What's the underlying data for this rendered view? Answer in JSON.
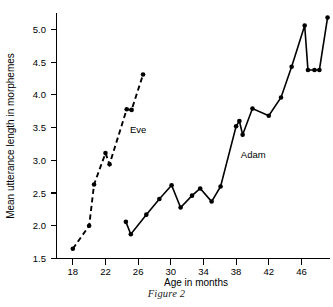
{
  "caption": "Figure 2",
  "chart_data": {
    "type": "line",
    "title": "",
    "xlabel": "Age in months",
    "ylabel": "Mean utterance length in morphemes",
    "xlim": [
      16,
      49.5
    ],
    "ylim": [
      1.5,
      5.25
    ],
    "xticks": [
      18,
      22,
      26,
      30,
      34,
      38,
      42,
      46
    ],
    "xtick_labels": [
      "18",
      "22",
      "26",
      "30",
      "34",
      "38",
      "42",
      "46"
    ],
    "yticks": [
      1.5,
      2.0,
      2.5,
      3.0,
      3.5,
      4.0,
      4.5,
      5.0
    ],
    "ytick_labels": [
      "1.5",
      "2.0",
      "2.5",
      "3.0",
      "3.5",
      "4.0",
      "4.5",
      "5.0"
    ],
    "grid": false,
    "legend": "inline-annotations",
    "series": [
      {
        "name": "Eve",
        "style": "dashed",
        "marker": "filled-circle",
        "label_x": 26.0,
        "label_y": 3.42,
        "x": [
          18.0,
          20.0,
          20.6,
          22.0,
          22.5,
          24.6,
          25.2,
          26.6
        ],
        "y": [
          1.65,
          2.0,
          2.63,
          3.11,
          2.94,
          3.78,
          3.77,
          4.31
        ]
      },
      {
        "name": "Adam",
        "style": "solid",
        "marker": "filled-circle",
        "label_x": 40.1,
        "label_y": 3.03,
        "x": [
          24.5,
          25.1,
          27.0,
          28.6,
          30.1,
          31.2,
          32.6,
          33.6,
          35.0,
          36.1,
          38.0,
          38.4,
          38.8,
          40.0,
          42.0,
          43.5,
          44.8,
          46.4,
          46.8,
          47.6,
          48.2,
          49.2
        ],
        "y": [
          2.06,
          1.87,
          2.17,
          2.41,
          2.62,
          2.28,
          2.46,
          2.57,
          2.37,
          2.6,
          3.52,
          3.6,
          3.39,
          3.79,
          3.68,
          3.96,
          4.43,
          5.06,
          4.38,
          4.38,
          4.38,
          5.18
        ]
      }
    ]
  }
}
